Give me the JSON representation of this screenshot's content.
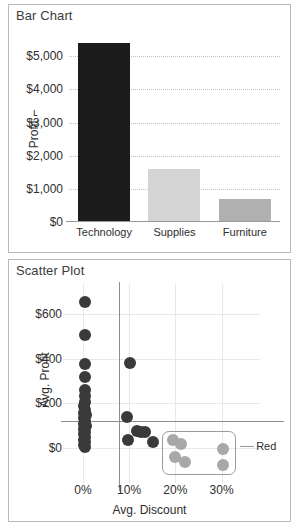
{
  "panels": {
    "bar": {
      "title": "Bar Chart"
    },
    "scatter": {
      "title": "Scatter Plot"
    }
  },
  "colors": {
    "technology": "#1c1c1c",
    "supplies": "#d4d4d4",
    "furniture": "#b0b0b0",
    "scatter_point": "#3a3a3a",
    "scatter_highlight": "#a8a8a8",
    "gridline": "#c2c2c2",
    "reference_line": "#8d8d8d",
    "panel_border": "#b9b9b9",
    "text": "#2e2e2e"
  },
  "chart_data": [
    {
      "type": "bar",
      "title": "Bar Chart",
      "categories": [
        "Technology",
        "Supplies",
        "Furniture"
      ],
      "values": [
        5400,
        1600,
        680
      ],
      "colors": [
        "#1c1c1c",
        "#d4d4d4",
        "#b0b0b0"
      ],
      "xlabel": "",
      "ylabel": "Profit",
      "ylabel_display": "Profit ⌐",
      "ylim": [
        0,
        5700
      ],
      "yticks": [
        0,
        1000,
        2000,
        3000,
        4000,
        5000
      ],
      "ytick_labels": [
        "$0",
        "$1,000",
        "$2,000",
        "$3,000",
        "$4,000",
        "$5,000"
      ],
      "grid": true,
      "legend": "none"
    },
    {
      "type": "scatter",
      "title": "Scatter Plot",
      "xlabel": "Avg. Discount",
      "ylabel": "Avg. Profit",
      "xlim": [
        -3,
        37
      ],
      "ylim": [
        -130,
        700
      ],
      "xticks": [
        0,
        10,
        20,
        30
      ],
      "xtick_labels": [
        "0%",
        "10%",
        "20%",
        "30%"
      ],
      "yticks": [
        0,
        200,
        400,
        600
      ],
      "ytick_labels": [
        "$0",
        "$200",
        "$400",
        "$600"
      ],
      "grid": true,
      "legend": "none",
      "reference_lines": [
        {
          "axis": "x",
          "value": 7.8
        },
        {
          "axis": "y",
          "value": 120
        }
      ],
      "annotations": [
        {
          "text": "Red",
          "x": 34,
          "y": 10
        }
      ],
      "selection_box": {
        "x0": 17.0,
        "x1": 33.0,
        "y0": -120,
        "y1": 75
      },
      "series": [
        {
          "name": "points",
          "color": "#3a3a3a",
          "points": [
            {
              "x": 0.4,
              "y": 655
            },
            {
              "x": 0.4,
              "y": 505
            },
            {
              "x": 0.4,
              "y": 378
            },
            {
              "x": 0.4,
              "y": 318
            },
            {
              "x": 0.4,
              "y": 262
            },
            {
              "x": 0.4,
              "y": 232
            },
            {
              "x": 0.5,
              "y": 205
            },
            {
              "x": 0.3,
              "y": 188
            },
            {
              "x": 0.5,
              "y": 172
            },
            {
              "x": 0.3,
              "y": 158
            },
            {
              "x": 0.6,
              "y": 146
            },
            {
              "x": 0.3,
              "y": 134
            },
            {
              "x": 0.5,
              "y": 122
            },
            {
              "x": 0.3,
              "y": 110
            },
            {
              "x": 0.6,
              "y": 98
            },
            {
              "x": 0.3,
              "y": 86
            },
            {
              "x": 0.5,
              "y": 74
            },
            {
              "x": 0.3,
              "y": 62
            },
            {
              "x": 0.5,
              "y": 50
            },
            {
              "x": 0.3,
              "y": 38
            },
            {
              "x": 0.5,
              "y": 26
            },
            {
              "x": 0.3,
              "y": 14
            },
            {
              "x": 0.5,
              "y": 4
            },
            {
              "x": 10.2,
              "y": 380
            },
            {
              "x": 9.6,
              "y": 140
            },
            {
              "x": 9.8,
              "y": 35
            },
            {
              "x": 11.8,
              "y": 78
            },
            {
              "x": 12.6,
              "y": 72
            },
            {
              "x": 13.4,
              "y": 70
            },
            {
              "x": 15.2,
              "y": 25
            }
          ]
        },
        {
          "name": "highlighted",
          "color": "#a8a8a8",
          "points": [
            {
              "x": 19.4,
              "y": 38
            },
            {
              "x": 21.2,
              "y": 20
            },
            {
              "x": 20.0,
              "y": -42
            },
            {
              "x": 22.0,
              "y": -62
            },
            {
              "x": 30.4,
              "y": -4
            },
            {
              "x": 30.4,
              "y": -74
            }
          ]
        }
      ]
    }
  ]
}
